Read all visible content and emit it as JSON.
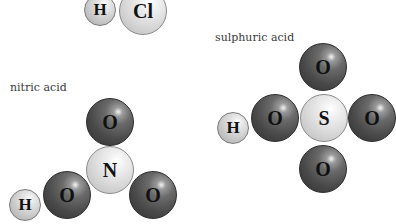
{
  "molecules": {
    "hcl": {
      "label": "",
      "atoms": [
        {
          "symbol": "H",
          "type": "hydrogen"
        },
        {
          "symbol": "Cl",
          "type": "chlorine"
        }
      ]
    },
    "nitric": {
      "label": "nitric acid",
      "atoms": [
        {
          "symbol": "O",
          "position": "top"
        },
        {
          "symbol": "N",
          "position": "center"
        },
        {
          "symbol": "O",
          "position": "left"
        },
        {
          "symbol": "H",
          "position": "far-left"
        },
        {
          "symbol": "O",
          "position": "right"
        }
      ]
    },
    "sulphuric": {
      "label": "sulphuric acid",
      "atoms": [
        {
          "symbol": "O",
          "position": "top"
        },
        {
          "symbol": "S",
          "position": "center"
        },
        {
          "symbol": "O",
          "position": "left"
        },
        {
          "symbol": "H",
          "position": "far-left"
        },
        {
          "symbol": "O",
          "position": "right"
        },
        {
          "symbol": "O",
          "position": "bottom"
        }
      ]
    }
  },
  "colors": {
    "oxygen": "#4a4a4a",
    "hydrogen": "#dcdcdc",
    "central_atom": "#d6d6d6",
    "label_text": "#3a3a3a"
  }
}
